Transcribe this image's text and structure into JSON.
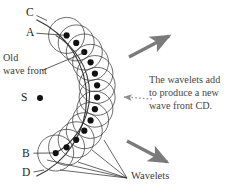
{
  "figure": {
    "title_fragment": "the principle is that the",
    "labels": {
      "point_c": "C",
      "point_a": "A",
      "point_b": "B",
      "point_d": "D",
      "source": "S",
      "old_wave_front_line1": "Old",
      "old_wave_front_line2": "wave front",
      "wavelets": "Wavelets",
      "annotation_line1": "The wavelets add",
      "annotation_line2": "to produce a new",
      "annotation_line3": "wave front CD."
    },
    "colors": {
      "stroke": "#333333",
      "dot": "#111111",
      "arrow": "#7b7b7b",
      "text": "#231f20",
      "annotation_text": "#4a4545",
      "background": "#ffffff"
    },
    "geometry": {
      "source_x": 40,
      "source_y": 98,
      "inner_arc_radius": 68,
      "outer_arc_radius": 86,
      "wavelet_radius": 18,
      "arc_start_deg": -67,
      "arc_end_deg": 67,
      "dot_count": 13
    },
    "arrows": [
      {
        "name": "propagation-arrow-upper",
        "x1": 129,
        "y1": 57,
        "x2": 171,
        "y2": 35
      },
      {
        "name": "propagation-arrow-lower",
        "x1": 127,
        "y1": 141,
        "x2": 169,
        "y2": 163
      }
    ]
  }
}
